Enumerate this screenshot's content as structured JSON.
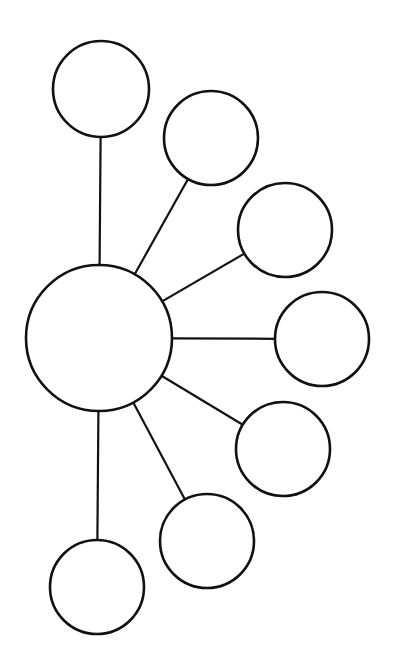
{
  "diagram": {
    "type": "bubble-map",
    "stroke_color": "#111111",
    "background_color": "#ffffff",
    "center_node": {
      "id": "center",
      "label": ""
    },
    "outer_nodes": [
      {
        "id": "node-1",
        "label": ""
      },
      {
        "id": "node-2",
        "label": ""
      },
      {
        "id": "node-3",
        "label": ""
      },
      {
        "id": "node-4",
        "label": ""
      },
      {
        "id": "node-5",
        "label": ""
      },
      {
        "id": "node-6",
        "label": ""
      },
      {
        "id": "node-7",
        "label": ""
      }
    ],
    "edges": [
      {
        "from": "center",
        "to": "node-1"
      },
      {
        "from": "center",
        "to": "node-2"
      },
      {
        "from": "center",
        "to": "node-3"
      },
      {
        "from": "center",
        "to": "node-4"
      },
      {
        "from": "center",
        "to": "node-5"
      },
      {
        "from": "center",
        "to": "node-6"
      },
      {
        "from": "center",
        "to": "node-7"
      }
    ]
  }
}
